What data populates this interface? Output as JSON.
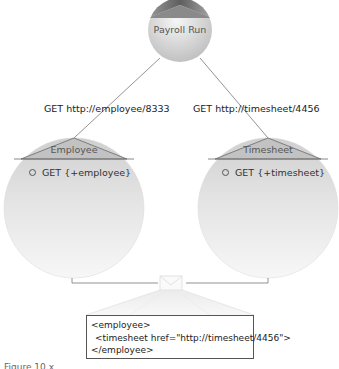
{
  "nodes": {
    "payroll": {
      "title": "Payroll Run"
    },
    "employee": {
      "title": "Employee",
      "method": "GET {+employee}"
    },
    "timesheet": {
      "title": "Timesheet",
      "method": "GET {+timesheet}"
    }
  },
  "edges": {
    "to_employee": {
      "label": "GET http://employee/8333"
    },
    "to_timesheet": {
      "label": "GET http://timesheet/4456"
    }
  },
  "representation": {
    "lines": [
      "<employee>",
      "  <timesheet href=\"http://timesheet/4456\">",
      "</employee>"
    ]
  },
  "caption": "Figure 10.x",
  "colors": {
    "sphere_light": "#f4f4f4",
    "sphere_dark": "#c8c8c8",
    "cap_dark": "#6e6e6e",
    "line": "#666666"
  }
}
